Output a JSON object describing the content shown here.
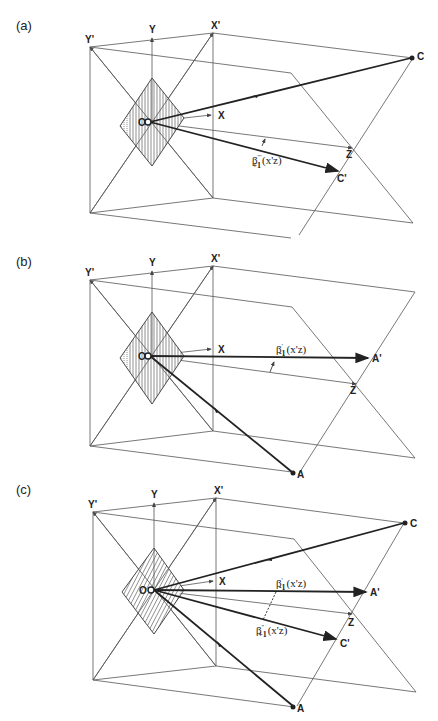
{
  "figure": {
    "panels": [
      {
        "id": "a",
        "label": "(a)",
        "axes": {
          "y_prime": "Y'",
          "y": "Y",
          "x_prime": "X'",
          "x": "X",
          "z": "Z",
          "origin": "O"
        },
        "points": [
          {
            "name": "C",
            "role": "source"
          },
          {
            "name": "C'",
            "role": "scattered"
          }
        ],
        "angle_labels": [
          {
            "symbol": "β",
            "sub": "+1",
            "sup": "'''",
            "arg": "(x'z)"
          }
        ]
      },
      {
        "id": "b",
        "label": "(b)",
        "axes": {
          "y_prime": "Y'",
          "y": "Y",
          "x_prime": "X'",
          "x": "X",
          "z": "Z",
          "origin": "O"
        },
        "points": [
          {
            "name": "A",
            "role": "source"
          },
          {
            "name": "A'",
            "role": "scattered"
          }
        ],
        "angle_labels": [
          {
            "symbol": "β",
            "sub": "-1",
            "sup": "'",
            "arg": "(x'z)"
          }
        ]
      },
      {
        "id": "c",
        "label": "(c)",
        "axes": {
          "y_prime": "Y'",
          "y": "Y",
          "x_prime": "X'",
          "x": "X",
          "z": "Z",
          "origin": "O"
        },
        "points": [
          {
            "name": "C",
            "role": "source"
          },
          {
            "name": "A",
            "role": "source"
          },
          {
            "name": "A'",
            "role": "scattered"
          },
          {
            "name": "C'",
            "role": "scattered"
          }
        ],
        "angle_labels": [
          {
            "symbol": "β",
            "sub": "-1",
            "sup": "'",
            "arg": "(x'z)"
          },
          {
            "symbol": "β",
            "sub": "+1",
            "sup": "''",
            "arg": "(x'z)"
          }
        ]
      }
    ],
    "text": {
      "a": {
        "label": "(a)",
        "Yp": "Y'",
        "Y": "Y",
        "Xp": "X'",
        "X": "X",
        "Z": "Z",
        "O": "O",
        "C": "C",
        "Cp": "C'",
        "beta_main": "β",
        "beta_sub": "+1",
        "beta_sup": "'''",
        "beta_arg": "(x'z)"
      },
      "b": {
        "label": "(b)",
        "Yp": "Y'",
        "Y": "Y",
        "Xp": "X'",
        "X": "X",
        "Z": "Z",
        "O": "O",
        "A": "A",
        "Ap": "A'",
        "beta_main": "β",
        "beta_sub": "-1",
        "beta_sup": "'",
        "beta_arg": "(x'z)"
      },
      "c": {
        "label": "(c)",
        "Yp": "Y'",
        "Y": "Y",
        "Xp": "X'",
        "X": "X",
        "Z": "Z",
        "O": "O",
        "C": "C",
        "A": "A",
        "Ap": "A'",
        "Cp": "C'",
        "beta1_main": "β",
        "beta1_sub": "-1",
        "beta1_sup": "'",
        "beta1_arg": "(x'z)",
        "beta2_main": "β",
        "beta2_sub": "+1",
        "beta2_sup": "''",
        "beta2_arg": "(x'z)"
      }
    }
  }
}
